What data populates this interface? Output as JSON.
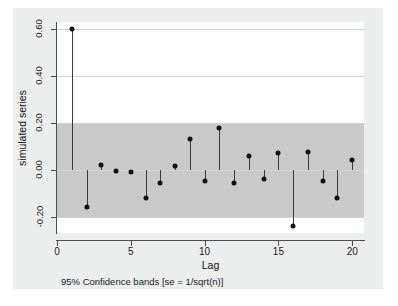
{
  "chart_data": {
    "type": "scatter",
    "title": "",
    "subtitle": "",
    "xlabel": "Lag",
    "ylabel": "simulated series",
    "note": "95% Confidence bands [se = 1/sqrt(n)]",
    "xlim": [
      0,
      20.8
    ],
    "ylim": [
      -0.27,
      0.63
    ],
    "xticks": [
      0,
      5,
      10,
      15,
      20
    ],
    "xticklabels": [
      "0",
      "5",
      "10",
      "15",
      "20"
    ],
    "yticks": [
      -0.2,
      0.0,
      0.2,
      0.4,
      0.6
    ],
    "yticklabels": [
      "-0.20",
      "0.00",
      "0.20",
      "0.40",
      "0.60"
    ],
    "grid": true,
    "legend": "none",
    "confidence_band": {
      "label": "95% Confidence bands [se = 1/sqrt(n)]",
      "upper": 0.2,
      "lower": -0.2,
      "color": "#c9c9c9"
    },
    "x": [
      1,
      2,
      3,
      4,
      5,
      6,
      7,
      8,
      9,
      10,
      11,
      12,
      13,
      14,
      15,
      16,
      17,
      18,
      19,
      20
    ],
    "values": [
      0.6,
      -0.16,
      0.02,
      -0.005,
      -0.01,
      -0.12,
      -0.055,
      0.015,
      0.13,
      -0.05,
      0.18,
      -0.055,
      0.06,
      -0.04,
      0.07,
      -0.24,
      0.075,
      -0.05,
      -0.12,
      0.04
    ],
    "marker_color": "#111111",
    "stem_color": "#3a3a3a"
  },
  "figure": {
    "background": "#eceeee",
    "plot_background": "#ffffff",
    "axis_color": "#4d4d4d",
    "grid_color": "#d3d3d3"
  }
}
